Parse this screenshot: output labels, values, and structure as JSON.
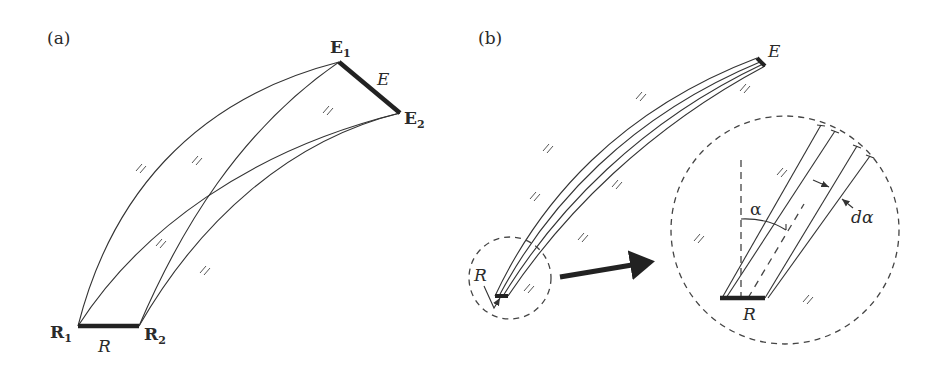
{
  "figure": {
    "panel_a": {
      "label": "(a)",
      "receiver_segment_label": "R",
      "emitter_segment_label": "E",
      "points": {
        "R1": {
          "label": "R",
          "sub": "1"
        },
        "R2": {
          "label": "R",
          "sub": "2"
        },
        "E1": {
          "label": "E",
          "sub": "1"
        },
        "E2": {
          "label": "E",
          "sub": "2"
        }
      },
      "hatch_symbol": "//"
    },
    "panel_b": {
      "label": "(b)",
      "emitter_label": "E",
      "receiver_label": "R",
      "zoom_receiver_label": "R",
      "angle_label": "α",
      "differential_angle_label": "dα",
      "hatch_symbol": "//"
    }
  }
}
